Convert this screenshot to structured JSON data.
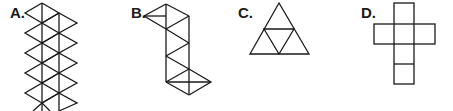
{
  "figures": [
    {
      "label": "A.",
      "description": "strip of equilateral triangles (icosahedron-like net), two offset columns of rhombi"
    },
    {
      "label": "B.",
      "description": "net of six triangles in a vertical strip with one wing triangle at top-left and one at bottom-right"
    },
    {
      "label": "C.",
      "description": "large triangle subdivided into four triangles (tetrahedron net)"
    },
    {
      "label": "D.",
      "description": "cross-shaped net of six squares (cube net)"
    }
  ],
  "colors": {
    "stroke": "#1a1a1a",
    "background": "#ffffff"
  }
}
